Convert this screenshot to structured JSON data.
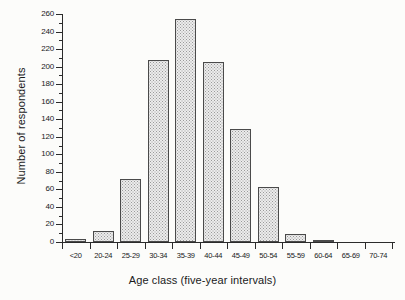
{
  "figure": {
    "background_color": "#fcfcfa",
    "ink_color": "#2b2b2b",
    "bar_fill_color": "#ececec",
    "bar_edge_color": "#4a4a4a"
  },
  "chart_data": {
    "type": "bar",
    "title": "",
    "subtitle": "",
    "xlabel": "Age class (five-year intervals)",
    "ylabel": "Number of respondents",
    "categories": [
      "<20",
      "20-24",
      "25-29",
      "30-34",
      "35-39",
      "40-44",
      "45-49",
      "50-54",
      "55-59",
      "60-64",
      "65-69",
      "70-74"
    ],
    "values": [
      3,
      12,
      72,
      207,
      254,
      205,
      129,
      63,
      9,
      2,
      0,
      0
    ],
    "ylim": [
      0,
      260
    ],
    "xlim": [
      0,
      12
    ],
    "ytick_labels": [
      "0",
      "20",
      "40",
      "60",
      "80",
      "100",
      "120",
      "140",
      "160",
      "180",
      "200",
      "220",
      "240",
      "260"
    ],
    "ytick_values": [
      0,
      20,
      40,
      60,
      80,
      100,
      120,
      140,
      160,
      180,
      200,
      220,
      240,
      260
    ],
    "yminor_tick_values": [
      10,
      30,
      50,
      70,
      90,
      110,
      130,
      150,
      170,
      190,
      210,
      230,
      250
    ],
    "ytick_interval": 20,
    "grid": false,
    "legend": false,
    "legend_position": "none",
    "bar_style": "contiguous-histogram-stippled",
    "annotations": []
  }
}
